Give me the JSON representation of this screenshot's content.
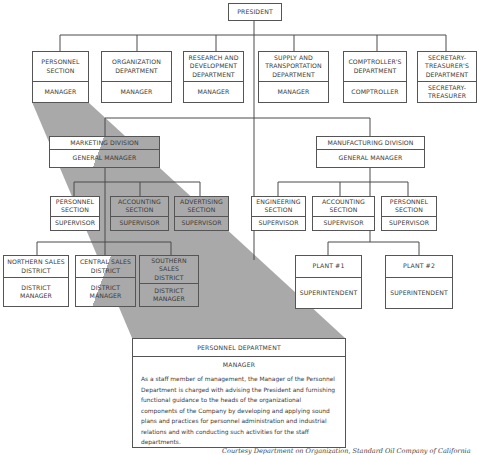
{
  "president": {
    "label": "PRESIDENT"
  },
  "top_departments": [
    {
      "name": "PERSONNEL\nSECTION",
      "head": "MANAGER"
    },
    {
      "name": "ORGANIZATION\nDEPARTMENT",
      "head": "MANAGER"
    },
    {
      "name": "RESEARCH AND\nDEVELOPMENT\nDEPARTMENT",
      "head": "MANAGER"
    },
    {
      "name": "SUPPLY AND\nTRANSPORTATION\nDEPARTMENT",
      "head": "MANAGER"
    },
    {
      "name": "COMPTROLLER'S\nDEPARTMENT",
      "head": "COMPTROLLER"
    },
    {
      "name": "SECRETARY-\nTREASURER'S\nDEPARTMENT",
      "head": "SECRETARY-\nTREASURER"
    }
  ],
  "marketing": {
    "name": "MARKETING DIVISION",
    "head": "GENERAL MANAGER",
    "sections": [
      {
        "name": "PERSONNEL\nSECTION",
        "head": "SUPERVISOR"
      },
      {
        "name": "ACCOUNTING\nSECTION",
        "head": "SUPERVISOR"
      },
      {
        "name": "ADVERTISING\nSECTION",
        "head": "SUPERVISOR"
      }
    ],
    "districts": [
      {
        "name": "NORTHERN SALES\nDISTRICT",
        "head": "DISTRICT\nMANAGER"
      },
      {
        "name": "CENTRAL SALES\nDISTRICT",
        "head": "DISTRICT\nMANAGER"
      },
      {
        "name": "SOUTHERN SALES\nDISTRICT",
        "head": "DISTRICT\nMANAGER"
      }
    ]
  },
  "manufacturing": {
    "name": "MANUFACTURING DIVISION",
    "head": "GENERAL MANAGER",
    "sections": [
      {
        "name": "ENGINEERING\nSECTION",
        "head": "SUPERVISOR"
      },
      {
        "name": "ACCOUNTING\nSECTION",
        "head": "SUPERVISOR"
      },
      {
        "name": "PERSONNEL\nSECTION",
        "head": "SUPERVISOR"
      }
    ],
    "plants": [
      {
        "name": "PLANT #1",
        "head": "SUPERINTENDENT"
      },
      {
        "name": "PLANT #2",
        "head": "SUPERINTENDENT"
      }
    ]
  },
  "detail": {
    "title": "PERSONNEL DEPARTMENT",
    "head": "MANAGER",
    "description": "As a staff member of management, the Manager of the Personnel Department is charged with advising the President and furnishing functional guidance to the heads of the organizational components of the Company by developing and applying sound plans and practices for personnel administration and industrial relations and with conducting such activities for the staff departments."
  },
  "caption": "Courtesy Department on Organization, Standard Oil Company of California",
  "colors": {
    "line": "#555555",
    "shade": "#a9a9a9",
    "background": "#ffffff"
  }
}
